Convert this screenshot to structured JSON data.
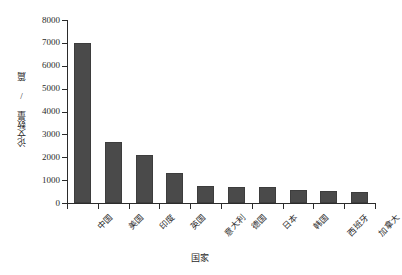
{
  "chart_data": {
    "type": "bar",
    "title": "",
    "xlabel": "国家",
    "ylabel": "论文数量 / 篇",
    "categories": [
      "中国",
      "美国",
      "印度",
      "英国",
      "意大利",
      "德国",
      "日本",
      "韩国",
      "西班牙",
      "加拿大"
    ],
    "values": [
      7000,
      2650,
      2100,
      1300,
      760,
      710,
      680,
      550,
      520,
      490
    ],
    "ylim": [
      0,
      8000
    ],
    "yticks": [
      0,
      1000,
      2000,
      3000,
      4000,
      5000,
      6000,
      7000,
      8000
    ],
    "ytick_labels": [
      "0",
      "1000",
      "2000",
      "3000",
      "4000",
      "5000",
      "6000",
      "7000",
      "8000"
    ],
    "grid": false,
    "legend": null,
    "bar_color": "#4a4a4a",
    "axis_color": "#2b2b2b"
  }
}
